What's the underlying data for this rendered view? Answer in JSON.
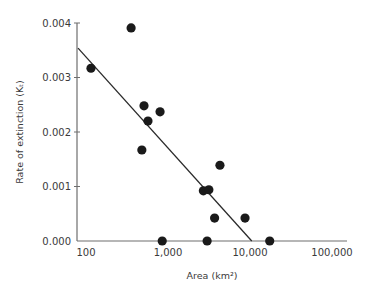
{
  "chart_data": {
    "type": "scatter",
    "title": "",
    "xlabel": "Area (km²)",
    "ylabel": "Rate of extinction (Kₜ)",
    "xscale": "log",
    "xlim": [
      80,
      130000
    ],
    "ylim": [
      0,
      0.004
    ],
    "grid": false,
    "legend": null,
    "x_ticks": [
      100,
      1000,
      10000,
      100000
    ],
    "x_tick_labels": [
      "100",
      "1,000",
      "10,000",
      "100,000"
    ],
    "y_ticks": [
      0,
      0.001,
      0.002,
      0.003,
      0.004
    ],
    "y_tick_labels": [
      "0.000",
      "0.001",
      "0.002",
      "0.003",
      "0.004"
    ],
    "series": [
      {
        "name": "islands",
        "type": "scatter",
        "color": "#1a1a1a",
        "points": [
          {
            "x": 115,
            "y": 0.00317
          },
          {
            "x": 355,
            "y": 0.00391
          },
          {
            "x": 510,
            "y": 0.00248
          },
          {
            "x": 570,
            "y": 0.0022
          },
          {
            "x": 800,
            "y": 0.00237
          },
          {
            "x": 480,
            "y": 0.00167
          },
          {
            "x": 850,
            "y": 0.0
          },
          {
            "x": 2700,
            "y": 0.00092
          },
          {
            "x": 3150,
            "y": 0.00094
          },
          {
            "x": 3000,
            "y": 0.0
          },
          {
            "x": 3700,
            "y": 0.00042
          },
          {
            "x": 4300,
            "y": 0.00139
          },
          {
            "x": 8700,
            "y": 0.00042
          },
          {
            "x": 17400,
            "y": 0.0
          }
        ]
      },
      {
        "name": "regression line",
        "type": "line",
        "color": "#2a2a2a",
        "points": [
          {
            "x": 80,
            "y": 0.00354
          },
          {
            "x": 10500,
            "y": 0.0
          }
        ]
      }
    ]
  },
  "layout": {
    "plot_left": 77,
    "plot_right": 347,
    "plot_top": 23,
    "plot_bottom": 241,
    "x_log_origin": 2,
    "x_origin_px": 86,
    "px_per_decade": 82,
    "axis_color": "#6e6e6e"
  }
}
